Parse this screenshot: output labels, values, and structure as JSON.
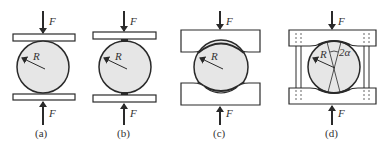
{
  "figure": {
    "panels": [
      {
        "id": "a",
        "caption": "(a)",
        "force_label": "F",
        "radius_label": "R",
        "contact": "point contact between flat plates"
      },
      {
        "id": "b",
        "caption": "(b)",
        "force_label": "F",
        "radius_label": "R",
        "contact": "small flat contact between flat plates"
      },
      {
        "id": "c",
        "caption": "(c)",
        "force_label": "F",
        "radius_label": "R",
        "contact": "curved seat blocks"
      },
      {
        "id": "d",
        "caption": "(d)",
        "force_label": "F",
        "radius_label": "R",
        "angle_label": "2α",
        "contact": "curved seat blocks with guide posts"
      }
    ]
  },
  "colors": {
    "stroke": "#2a2a2a",
    "circle_fill": "#e6e6e6",
    "plate_fill": "#ffffff",
    "text": "#333333"
  }
}
